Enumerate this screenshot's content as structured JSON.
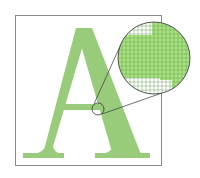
{
  "figure": {
    "letter": "A",
    "colors": {
      "letter_fill": "#99cc7a",
      "magnified_fill": "#a8e47e",
      "grid_line": "#5a8a4a",
      "frame": "#8a8a8a",
      "background": "#ffffff"
    }
  }
}
